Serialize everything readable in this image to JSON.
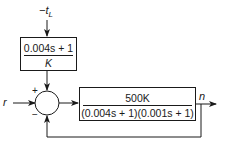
{
  "diagram": {
    "type": "block-diagram",
    "inputs": {
      "reference": {
        "label": "r"
      },
      "disturbance": {
        "label": "−t",
        "subscript": "L"
      }
    },
    "output": {
      "label": "n"
    },
    "summing_junction": {
      "plus_label": "+",
      "minus_label": "−"
    },
    "blocks": [
      {
        "id": "disturbance-block",
        "numerator": "0.004s + 1",
        "denominator": "K"
      },
      {
        "id": "plant-block",
        "numerator": "500K",
        "denominator": "(0.004s + 1)(0.001s + 1)"
      }
    ],
    "connections": [
      {
        "from": "disturbance",
        "to": "disturbance-block"
      },
      {
        "from": "disturbance-block",
        "to": "summing-junction",
        "sign": "+"
      },
      {
        "from": "reference",
        "to": "summing-junction"
      },
      {
        "from": "summing-junction",
        "to": "plant-block"
      },
      {
        "from": "plant-block",
        "to": "output"
      },
      {
        "from": "output",
        "to": "summing-junction",
        "sign": "−",
        "type": "feedback"
      }
    ],
    "colors": {
      "line": "#1a1a1a",
      "background": "#ffffff"
    }
  }
}
